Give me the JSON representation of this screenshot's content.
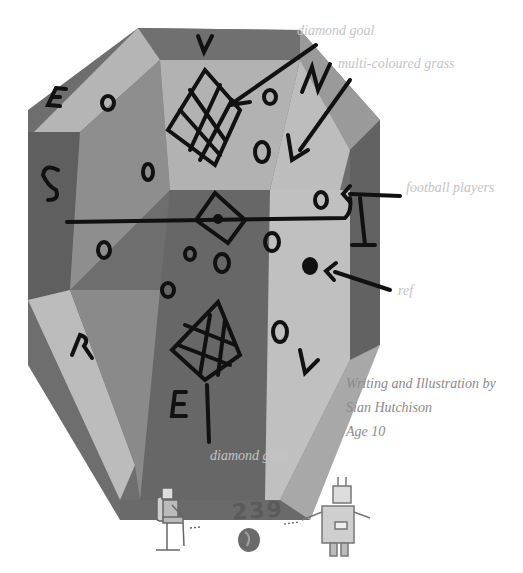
{
  "illustration": {
    "title": "Football pitch drawing",
    "pitch_letters": [
      "U",
      "N",
      "I",
      "V",
      "E",
      "R",
      "S",
      "E"
    ],
    "colors": {
      "dark": "#6a6a6a",
      "mid": "#8c8c8c",
      "light": "#b8b8b8",
      "pale": "#c8c8c8",
      "ink": "#111111"
    }
  },
  "labels": {
    "diamond_goal_top": "diamond goal",
    "multi_coloured_grass": "multi-coloured grass",
    "football_players": "football players",
    "ref": "ref",
    "diamond_goal_bottom": "diamond goal"
  },
  "credit": {
    "line1": "Writing and Illustration by",
    "line2": "Sian Hutchison",
    "line3": "Age 10"
  },
  "footer": {
    "page_number": "239"
  }
}
